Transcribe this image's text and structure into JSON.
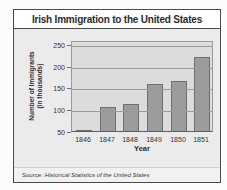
{
  "figure": {
    "title": "Irish Immigration to the United States",
    "source_prefix": "Source:",
    "source_title": "Historical Statistics of the United States"
  },
  "chart_data": {
    "type": "bar",
    "title": "Irish Immigration to the United States",
    "categories": [
      "1846",
      "1847",
      "1848",
      "1849",
      "1850",
      "1851"
    ],
    "values": [
      51,
      105,
      112,
      159,
      164,
      221
    ],
    "xlabel": "Year",
    "ylabel": "Number of Immigrants (in thousands)",
    "ylabel_line1": "Number of Immigrants",
    "ylabel_line2": "(in thousands)",
    "yticks": [
      50,
      100,
      150,
      200,
      250
    ],
    "ylim": [
      50,
      259
    ],
    "grid": true,
    "legend": false,
    "source": "Source: Historical Statistics of the United States",
    "colors": {
      "bar_fill": "#9c9c9c",
      "bar_border": "#6f6f6f",
      "plot_bg": "#dcdcdc",
      "panel_bg": "#ebebeb",
      "gridline": "#9a9a9a",
      "figure_border": "#4a4a4a"
    }
  }
}
